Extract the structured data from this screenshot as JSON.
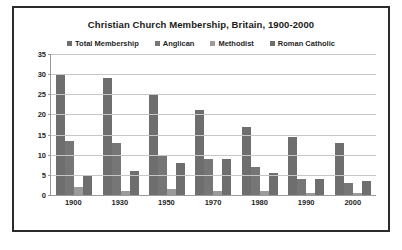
{
  "chart_data": {
    "type": "bar",
    "title": "Christian Church Membership, Britain, 1900-2000",
    "xlabel": "",
    "ylabel": "",
    "ylim": [
      0,
      35
    ],
    "yticks": [
      0,
      5,
      10,
      15,
      20,
      25,
      30,
      35
    ],
    "grid": true,
    "legend_position": "top",
    "categories": [
      "1900",
      "1930",
      "1950",
      "1970",
      "1980",
      "1990",
      "2000"
    ],
    "series": [
      {
        "name": "Total Membership",
        "color": "#6e6e6e",
        "values": [
          30,
          29,
          25,
          21,
          17,
          14.5,
          13
        ]
      },
      {
        "name": "Anglican",
        "color": "#767676",
        "values": [
          13.5,
          13,
          10,
          9,
          7,
          4,
          3
        ]
      },
      {
        "name": "Methodist",
        "color": "#9b9b9b",
        "values": [
          2,
          1,
          1.5,
          1,
          1,
          0.5,
          0.5
        ]
      },
      {
        "name": "Roman Catholic",
        "color": "#6e6e6e",
        "values": [
          5,
          6,
          8,
          9,
          5.5,
          4,
          3.5
        ]
      }
    ]
  },
  "colors": {
    "frame_border": "#2b2b2b",
    "gridline": "#c6c6c6",
    "axis_line": "#9a9a9a",
    "text": "#1f1f1f",
    "background": "#ffffff"
  }
}
